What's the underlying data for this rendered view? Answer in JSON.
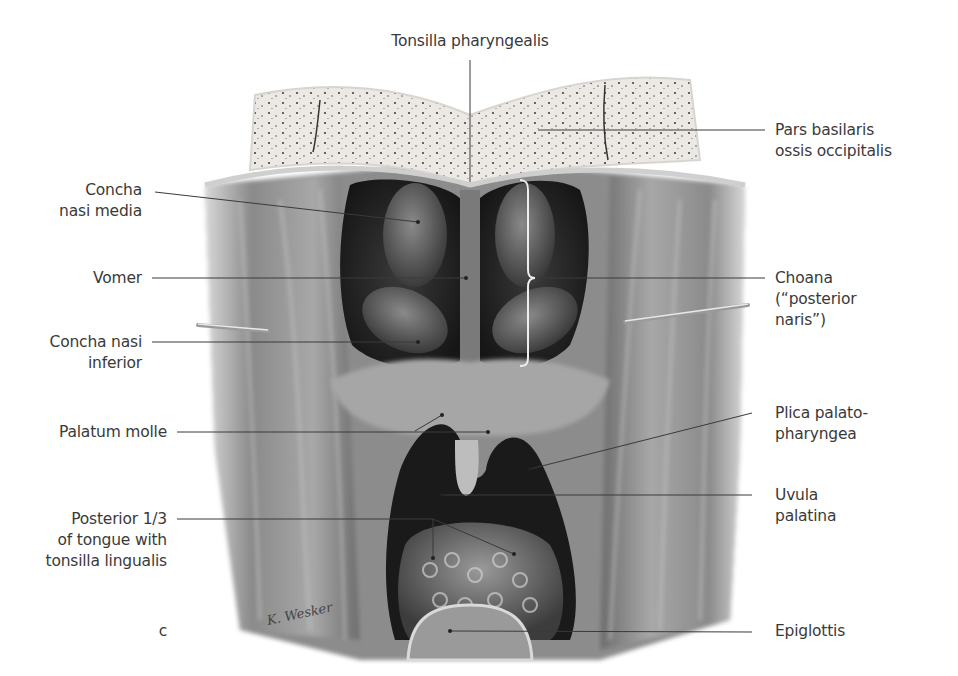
{
  "figure": {
    "panel_letter": "c",
    "signature": "K. Wesker",
    "colors": {
      "line": "#3a3a3a",
      "text": "#3a3a3a",
      "bone": "#ece9e4",
      "tissue_dark": "#2a2a2a",
      "tissue_mid": "#7a7a7a",
      "tissue_light": "#b9b9b9"
    }
  },
  "labels": {
    "top": {
      "tonsilla_pharyngealis": "Tonsilla pharyngealis"
    },
    "left": {
      "concha_nasi_media": "Concha\nnasi media",
      "vomer": "Vomer",
      "concha_nasi_inferior": "Concha nasi\ninferior",
      "palatum_molle": "Palatum molle",
      "posterior_tongue": "Posterior 1/3\nof tongue with\ntonsilla lingualis"
    },
    "right": {
      "pars_basilaris": "Pars basilaris\nossis occipitalis",
      "choana": "Choana\n(“posterior\nnaris”)",
      "plica_palatopharyngea": "Plica palato-\npharyngea",
      "uvula_palatina": "Uvula\npalatina",
      "epiglottis": "Epiglottis"
    }
  }
}
